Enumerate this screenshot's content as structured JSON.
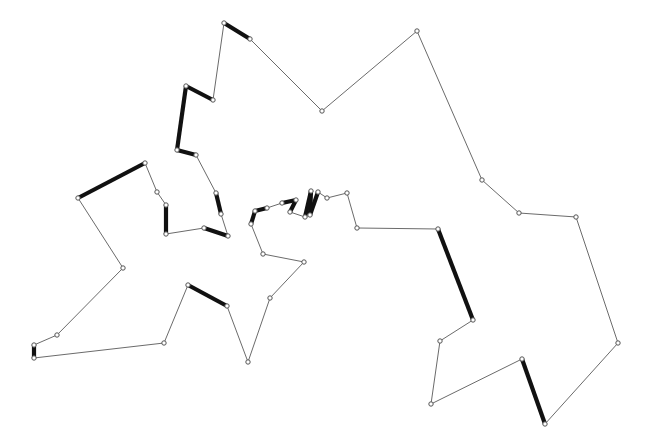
{
  "figure": {
    "width": 646,
    "height": 446,
    "background_color": "#ffffff",
    "thin_edge_color": "#6b6b6b",
    "thick_edge_color": "#111111",
    "vertex_stroke_color": "#555555",
    "vertex_fill_color": "#ffffff",
    "thin_edge_width": 1,
    "thick_edge_width": 4.2,
    "vertex_radius": 2.2
  },
  "chart_data": {
    "type": "line",
    "title": "",
    "xlabel": "",
    "ylabel": "",
    "xlim": [
      0,
      646
    ],
    "ylim": [
      0,
      446
    ],
    "grid": false,
    "legend": "none",
    "closed": true,
    "series": [
      {
        "name": "polygon-boundary",
        "points": [
          [
            224,
            23
          ],
          [
            250,
            39
          ],
          [
            322,
            111
          ],
          [
            417,
            31
          ],
          [
            482,
            180
          ],
          [
            519,
            213
          ],
          [
            576,
            217
          ],
          [
            618,
            343
          ],
          [
            545,
            424
          ],
          [
            522,
            359
          ],
          [
            431,
            404
          ],
          [
            440,
            341
          ],
          [
            473,
            320
          ],
          [
            438,
            229
          ],
          [
            357,
            228
          ],
          [
            347,
            193
          ],
          [
            327,
            198
          ],
          [
            318,
            192
          ],
          [
            310,
            215
          ],
          [
            311,
            191
          ],
          [
            305,
            217
          ],
          [
            290,
            212
          ],
          [
            296,
            200
          ],
          [
            282,
            203
          ],
          [
            267,
            208
          ],
          [
            255,
            211
          ],
          [
            251,
            224
          ],
          [
            263,
            254
          ],
          [
            304,
            262
          ],
          [
            270,
            298
          ],
          [
            248,
            362
          ],
          [
            227,
            306
          ],
          [
            188,
            285
          ],
          [
            164,
            343
          ],
          [
            34,
            358
          ],
          [
            34,
            345
          ],
          [
            57,
            335
          ],
          [
            123,
            268
          ],
          [
            78,
            198
          ],
          [
            145,
            163
          ],
          [
            157,
            192
          ],
          [
            166,
            205
          ],
          [
            166,
            234
          ],
          [
            204,
            228
          ],
          [
            228,
            236
          ],
          [
            221,
            214
          ],
          [
            216,
            193
          ],
          [
            196,
            155
          ],
          [
            177,
            150
          ],
          [
            186,
            86
          ],
          [
            213,
            100
          ]
        ],
        "thick_segments": [
          [
            0,
            1
          ],
          [
            8,
            9
          ],
          [
            12,
            13
          ],
          [
            17,
            18
          ],
          [
            18,
            19
          ],
          [
            19,
            20
          ],
          [
            21,
            22
          ],
          [
            22,
            23
          ],
          [
            24,
            25
          ],
          [
            25,
            26
          ],
          [
            31,
            32
          ],
          [
            34,
            35
          ],
          [
            38,
            39
          ],
          [
            41,
            42
          ],
          [
            43,
            44
          ],
          [
            45,
            46
          ],
          [
            47,
            48
          ],
          [
            48,
            49
          ],
          [
            49,
            50
          ]
        ]
      }
    ]
  }
}
